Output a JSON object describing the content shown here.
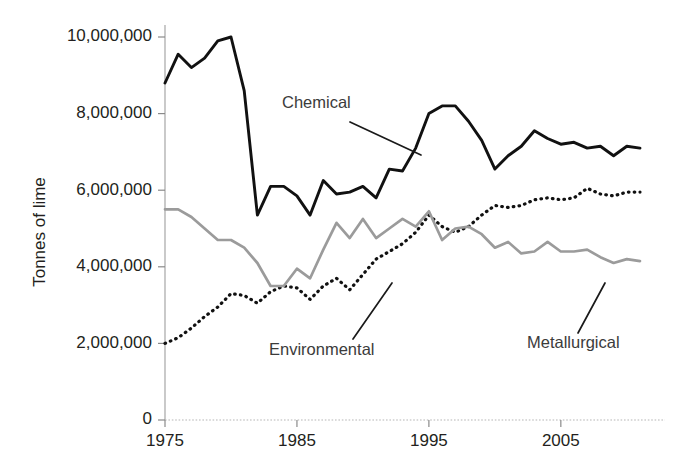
{
  "chart_data": {
    "type": "line",
    "title": "",
    "xlabel": "",
    "ylabel": "Tonnes of lime",
    "xlim": [
      1975,
      2011
    ],
    "ylim": [
      0,
      10000000
    ],
    "grid": false,
    "legend_position": "inline-annotations",
    "x_tick_labels": [
      "1975",
      "1985",
      "1995",
      "2005"
    ],
    "x_ticks": [
      1975,
      1985,
      1995,
      2005
    ],
    "y_tick_labels": [
      "0",
      "2,000,000",
      "4,000,000",
      "6,000,000",
      "8,000,000",
      "10,000,000"
    ],
    "y_ticks": [
      0,
      2000000,
      4000000,
      6000000,
      8000000,
      10000000
    ],
    "x": [
      1975,
      1976,
      1977,
      1978,
      1979,
      1980,
      1981,
      1982,
      1983,
      1984,
      1985,
      1986,
      1987,
      1988,
      1989,
      1990,
      1991,
      1992,
      1993,
      1994,
      1995,
      1996,
      1997,
      1998,
      1999,
      2000,
      2001,
      2002,
      2003,
      2004,
      2005,
      2006,
      2007,
      2008,
      2009,
      2010,
      2011
    ],
    "series": [
      {
        "name": "Chemical",
        "style": "solid",
        "color": "#111111",
        "label_text": "Chemical",
        "values": [
          8800000,
          9550000,
          9200000,
          9450000,
          9900000,
          10000000,
          8600000,
          5350000,
          6100000,
          6100000,
          5850000,
          5350000,
          6250000,
          5900000,
          5950000,
          6100000,
          5800000,
          6550000,
          6500000,
          7100000,
          8000000,
          8200000,
          8200000,
          7800000,
          7300000,
          6550000,
          6900000,
          7150000,
          7550000,
          7350000,
          7200000,
          7250000,
          7100000,
          7150000,
          6900000,
          7150000,
          7100000
        ]
      },
      {
        "name": "Environmental",
        "style": "dotted",
        "color": "#111111",
        "label_text": "Environmental",
        "values": [
          2000000,
          2150000,
          2400000,
          2700000,
          2950000,
          3300000,
          3250000,
          3050000,
          3350000,
          3500000,
          3450000,
          3150000,
          3500000,
          3700000,
          3400000,
          3800000,
          4200000,
          4400000,
          4600000,
          4900000,
          5350000,
          5050000,
          4900000,
          5050000,
          5350000,
          5600000,
          5550000,
          5600000,
          5750000,
          5800000,
          5750000,
          5800000,
          6050000,
          5900000,
          5850000,
          5950000,
          5950000
        ]
      },
      {
        "name": "Metallurgical",
        "style": "solid",
        "color": "#9b9b9b",
        "label_text": "Metallurgical",
        "values": [
          5500000,
          5500000,
          5300000,
          5000000,
          4700000,
          4700000,
          4500000,
          4100000,
          3500000,
          3500000,
          3950000,
          3700000,
          4450000,
          5150000,
          4750000,
          5250000,
          4750000,
          5000000,
          5250000,
          5050000,
          5450000,
          4700000,
          5000000,
          5050000,
          4850000,
          4500000,
          4650000,
          4350000,
          4400000,
          4650000,
          4400000,
          4400000,
          4450000,
          4250000,
          4100000,
          4200000,
          4150000
        ]
      }
    ],
    "annotations": [
      {
        "text": "Chemical",
        "x_px": 282,
        "y_px": 108
      },
      {
        "text": "Environmental",
        "x_px": 269,
        "y_px": 355
      },
      {
        "text": "Metallurgical",
        "x_px": 527,
        "y_px": 348
      }
    ]
  }
}
